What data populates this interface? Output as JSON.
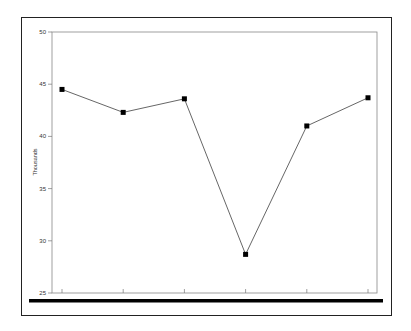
{
  "chart_data": {
    "type": "line",
    "title": "",
    "xlabel": "",
    "ylabel": "Thousands",
    "ylim": [
      25,
      50
    ],
    "yticks": [
      25,
      30,
      35,
      40,
      45,
      50
    ],
    "ytick_labels": [
      "25",
      "30",
      "35",
      "40",
      "45",
      "50"
    ],
    "categories": [
      "1",
      "2",
      "3",
      "4",
      "5",
      "6"
    ],
    "x_tick_labels_visible": false,
    "grid": false,
    "legend": null,
    "series": [
      {
        "name": "Series 1",
        "values": [
          44.5,
          42.3,
          43.6,
          28.7,
          41.0,
          43.7
        ],
        "marker": "square",
        "color": "#000000",
        "line_color": "#555555"
      }
    ]
  },
  "colors": {
    "frame": "#222222",
    "axis": "#777777",
    "baseline_bar": "#000000",
    "background": "#ffffff"
  }
}
